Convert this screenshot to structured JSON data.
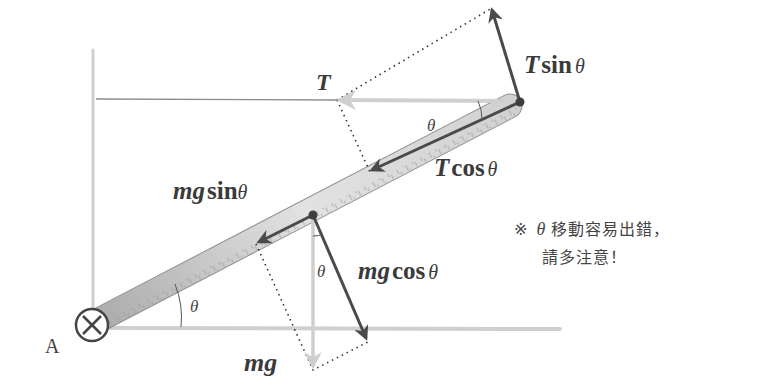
{
  "diagram": {
    "pivot_label": "A",
    "forces": {
      "tension": {
        "symbol": "T"
      },
      "tension_perp": {
        "prefix": "T",
        "fn": "sin",
        "angle": "θ"
      },
      "tension_parallel": {
        "prefix": "T",
        "fn": "cos",
        "angle": "θ"
      },
      "weight": {
        "symbol": "mg"
      },
      "weight_parallel": {
        "prefix": "mg",
        "fn": "sin",
        "angle": "θ"
      },
      "weight_perp": {
        "prefix": "mg",
        "fn": "cos",
        "angle": "θ"
      }
    },
    "angle_labels": [
      "θ",
      "θ",
      "θ"
    ],
    "note": {
      "line1_mark": "※",
      "line1_theta": "θ",
      "line1_text": "移動容易出錯，",
      "line2_text": "請多注意！"
    },
    "colors": {
      "dark_arrow": "#4a4a4a",
      "light_arrow": "#c8c8c8",
      "rod_fill": "#d4d4d4",
      "wall": "#cfcfcf"
    }
  }
}
